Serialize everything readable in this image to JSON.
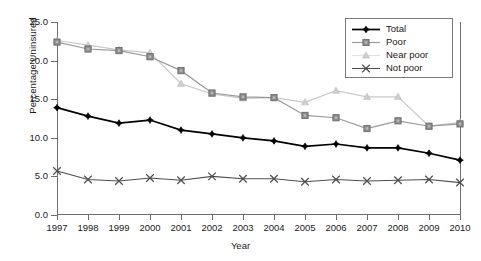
{
  "chart_data": {
    "type": "line",
    "title": "",
    "xlabel": "Year",
    "ylabel": "Percentage Uninsured",
    "grid": false,
    "legend_position": "top-right",
    "xlim": [
      1997,
      2010
    ],
    "ylim": [
      0.0,
      25.0
    ],
    "ytick_labels": [
      "0.0",
      "5.0",
      "10.0",
      "15.0",
      "20.0",
      "25.0"
    ],
    "ytick_values": [
      0.0,
      5.0,
      10.0,
      15.0,
      20.0,
      25.0
    ],
    "categories": [
      "1997",
      "1998",
      "1999",
      "2000",
      "2001",
      "2002",
      "2003",
      "2004",
      "2005",
      "2006",
      "2007",
      "2008",
      "2009",
      "2010"
    ],
    "x": [
      1997,
      1998,
      1999,
      2000,
      2001,
      2002,
      2003,
      2004,
      2005,
      2006,
      2007,
      2008,
      2009,
      2010
    ],
    "series": [
      {
        "name": "Total",
        "marker": "diamond",
        "color": "#000000",
        "values": [
          13.9,
          12.8,
          11.9,
          12.3,
          11.0,
          10.5,
          10.0,
          9.6,
          8.9,
          9.2,
          8.7,
          8.7,
          8.0,
          7.1
        ]
      },
      {
        "name": "Poor",
        "marker": "square",
        "color": "#8c8c8c",
        "values": [
          22.4,
          21.5,
          21.3,
          20.5,
          18.7,
          15.8,
          15.3,
          15.2,
          12.9,
          12.6,
          11.2,
          12.2,
          11.5,
          11.8
        ]
      },
      {
        "name": "Near poor",
        "marker": "triangle",
        "color": "#cfcfcf",
        "values": [
          22.6,
          22.0,
          21.4,
          21.0,
          17.0,
          15.7,
          15.1,
          15.2,
          14.6,
          16.1,
          15.3,
          15.3,
          11.5,
          12.0
        ]
      },
      {
        "name": "Not poor",
        "marker": "x",
        "color": "#4f4f4f",
        "values": [
          5.7,
          4.6,
          4.4,
          4.8,
          4.5,
          5.0,
          4.7,
          4.7,
          4.3,
          4.6,
          4.4,
          4.5,
          4.6,
          4.2
        ]
      }
    ]
  },
  "legend": {
    "entries": [
      {
        "label": "Total"
      },
      {
        "label": "Poor"
      },
      {
        "label": "Near poor"
      },
      {
        "label": "Not poor"
      }
    ]
  },
  "axes": {
    "x_title": "Year",
    "y_title": "Percentage Uninsured"
  }
}
